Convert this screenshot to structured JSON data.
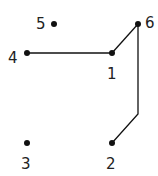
{
  "diagram": {
    "type": "graph",
    "colors": {
      "node": "#111111",
      "edge": "#111111",
      "label": "#222222"
    },
    "nodes": [
      {
        "id": "1",
        "label": "1",
        "x": 112,
        "y": 53,
        "lx": 107,
        "ly": 74
      },
      {
        "id": "2",
        "label": "2",
        "x": 112,
        "y": 143,
        "lx": 106,
        "ly": 164
      },
      {
        "id": "3",
        "label": "3",
        "x": 27,
        "y": 143,
        "lx": 21,
        "ly": 164
      },
      {
        "id": "4",
        "label": "4",
        "x": 27,
        "y": 53,
        "lx": 8,
        "ly": 58
      },
      {
        "id": "5",
        "label": "5",
        "x": 54,
        "y": 24,
        "lx": 36,
        "ly": 24
      },
      {
        "id": "6",
        "label": "6",
        "x": 138,
        "y": 24,
        "lx": 145,
        "ly": 23
      }
    ],
    "edges": [
      {
        "from": "4",
        "to": "1",
        "points": [
          [
            27,
            53
          ],
          [
            112,
            53
          ]
        ]
      },
      {
        "from": "1",
        "to": "6",
        "points": [
          [
            112,
            53
          ],
          [
            138,
            24
          ]
        ]
      },
      {
        "from": "6",
        "to": "2",
        "points": [
          [
            138,
            24
          ],
          [
            138,
            114
          ],
          [
            112,
            143
          ]
        ]
      }
    ]
  }
}
